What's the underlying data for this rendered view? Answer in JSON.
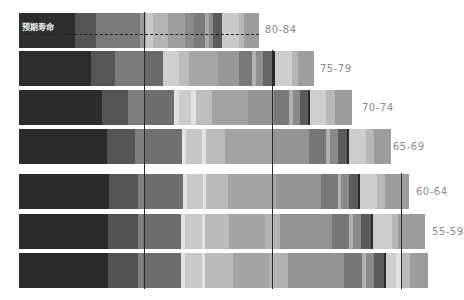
{
  "chart_data": {
    "type": "bar",
    "orientation": "horizontal-stacked",
    "title": "预期寿命",
    "annotation": "预期寿命",
    "categories": [
      "80-84",
      "75-79",
      "70-74",
      "65-69",
      "60-64",
      "55-59",
      ""
    ],
    "bar_lengths_px": [
      240,
      295,
      337,
      368,
      390,
      406,
      416
    ],
    "series_note": "Each bar is composed of many grayscale segments; widths estimated in pixels",
    "vertical_markers_x_px": [
      144,
      272,
      401
    ],
    "grid": false,
    "legend": "none"
  },
  "bars": [
    {
      "label": "80-84",
      "top": 13,
      "segments": [
        {
          "w": 56,
          "c": "#2e2e2e"
        },
        {
          "w": 21,
          "c": "#555555"
        },
        {
          "w": 44,
          "c": "#7a7a7a"
        },
        {
          "w": 6,
          "c": "#9a9a9a"
        },
        {
          "w": 7,
          "c": "#c8c8c8"
        },
        {
          "w": 15,
          "c": "#b4b4b4"
        },
        {
          "w": 17,
          "c": "#9e9e9e"
        },
        {
          "w": 9,
          "c": "#8a8a8a"
        },
        {
          "w": 11,
          "c": "#7b7b7b"
        },
        {
          "w": 4,
          "c": "#a8a8a8"
        },
        {
          "w": 4,
          "c": "#8a8a8a"
        },
        {
          "w": 9,
          "c": "#5a5a5a"
        },
        {
          "w": 17,
          "c": "#cacaca"
        },
        {
          "w": 5,
          "c": "#b8b8b8"
        },
        {
          "w": 15,
          "c": "#9c9c9c"
        }
      ]
    },
    {
      "label": "75-79",
      "top": 51,
      "segments": [
        {
          "w": 72,
          "c": "#2d2d2d"
        },
        {
          "w": 24,
          "c": "#565656"
        },
        {
          "w": 30,
          "c": "#7a7a7a"
        },
        {
          "w": 18,
          "c": "#6a6a6a"
        },
        {
          "w": 16,
          "c": "#cfcfcf"
        },
        {
          "w": 10,
          "c": "#bcbcbc"
        },
        {
          "w": 29,
          "c": "#a6a6a6"
        },
        {
          "w": 21,
          "c": "#979797"
        },
        {
          "w": 13,
          "c": "#787878"
        },
        {
          "w": 4,
          "c": "#b2b2b2"
        },
        {
          "w": 7,
          "c": "#8e8e8e"
        },
        {
          "w": 9,
          "c": "#666666"
        },
        {
          "w": 3,
          "c": "#2a2a2a"
        },
        {
          "w": 17,
          "c": "#cdcdcd"
        },
        {
          "w": 6,
          "c": "#b5b5b5"
        },
        {
          "w": 16,
          "c": "#9e9e9e"
        }
      ]
    },
    {
      "label": "70-74",
      "top": 90,
      "segments": [
        {
          "w": 83,
          "c": "#2c2c2c"
        },
        {
          "w": 26,
          "c": "#545454"
        },
        {
          "w": 16,
          "c": "#7e7e7e"
        },
        {
          "w": 30,
          "c": "#6e6e6e"
        },
        {
          "w": 5,
          "c": "#e0e0e0"
        },
        {
          "w": 12,
          "c": "#cbcbcb"
        },
        {
          "w": 5,
          "c": "#e3e3e3"
        },
        {
          "w": 16,
          "c": "#bebebe"
        },
        {
          "w": 36,
          "c": "#a3a3a3"
        },
        {
          "w": 26,
          "c": "#939393"
        },
        {
          "w": 15,
          "c": "#787878"
        },
        {
          "w": 4,
          "c": "#b0b0b0"
        },
        {
          "w": 7,
          "c": "#8b8b8b"
        },
        {
          "w": 8,
          "c": "#5c5c5c"
        },
        {
          "w": 2,
          "c": "#2a2a2a"
        },
        {
          "w": 16,
          "c": "#cfcfcf"
        },
        {
          "w": 9,
          "c": "#b8b8b8"
        },
        {
          "w": 17,
          "c": "#9c9c9c"
        }
      ]
    },
    {
      "label": "65-69",
      "top": 129,
      "segments": [
        {
          "w": 88,
          "c": "#2b2b2b"
        },
        {
          "w": 28,
          "c": "#555555"
        },
        {
          "w": 10,
          "c": "#7f7f7f"
        },
        {
          "w": 37,
          "c": "#6f6f6f"
        },
        {
          "w": 4,
          "c": "#e4e4e4"
        },
        {
          "w": 16,
          "c": "#c8c8c8"
        },
        {
          "w": 4,
          "c": "#e2e2e2"
        },
        {
          "w": 19,
          "c": "#bcbcbc"
        },
        {
          "w": 47,
          "c": "#a3a3a3"
        },
        {
          "w": 37,
          "c": "#949494"
        },
        {
          "w": 17,
          "c": "#777777"
        },
        {
          "w": 4,
          "c": "#b0b0b0"
        },
        {
          "w": 8,
          "c": "#8a8a8a"
        },
        {
          "w": 9,
          "c": "#5b5b5b"
        },
        {
          "w": 2,
          "c": "#2a2a2a"
        },
        {
          "w": 17,
          "c": "#cdcdcd"
        },
        {
          "w": 8,
          "c": "#b8b8b8"
        },
        {
          "w": 17,
          "c": "#9c9c9c"
        }
      ]
    },
    {
      "label": "60-64",
      "top": 174,
      "segments": [
        {
          "w": 90,
          "c": "#2b2b2b"
        },
        {
          "w": 29,
          "c": "#545454"
        },
        {
          "w": 6,
          "c": "#808080"
        },
        {
          "w": 39,
          "c": "#6e6e6e"
        },
        {
          "w": 4,
          "c": "#e2e2e2"
        },
        {
          "w": 16,
          "c": "#c9c9c9"
        },
        {
          "w": 3,
          "c": "#e2e2e2"
        },
        {
          "w": 22,
          "c": "#bbbbbb"
        },
        {
          "w": 48,
          "c": "#a4a4a4"
        },
        {
          "w": 45,
          "c": "#939393"
        },
        {
          "w": 17,
          "c": "#787878"
        },
        {
          "w": 3,
          "c": "#b0b0b0"
        },
        {
          "w": 8,
          "c": "#8a8a8a"
        },
        {
          "w": 9,
          "c": "#5c5c5c"
        },
        {
          "w": 2,
          "c": "#2a2a2a"
        },
        {
          "w": 17,
          "c": "#cdcdcd"
        },
        {
          "w": 8,
          "c": "#b8b8b8"
        },
        {
          "w": 24,
          "c": "#9c9c9c"
        }
      ]
    },
    {
      "label": "55-59",
      "top": 214,
      "segments": [
        {
          "w": 89,
          "c": "#2a2a2a"
        },
        {
          "w": 30,
          "c": "#535353"
        },
        {
          "w": 5,
          "c": "#808080"
        },
        {
          "w": 38,
          "c": "#6d6d6d"
        },
        {
          "w": 4,
          "c": "#e2e2e2"
        },
        {
          "w": 17,
          "c": "#c9c9c9"
        },
        {
          "w": 3,
          "c": "#e2e2e2"
        },
        {
          "w": 24,
          "c": "#bbbbbb"
        },
        {
          "w": 36,
          "c": "#a4a4a4"
        },
        {
          "w": 15,
          "c": "#b2b2b2"
        },
        {
          "w": 52,
          "c": "#939393"
        },
        {
          "w": 17,
          "c": "#777777"
        },
        {
          "w": 4,
          "c": "#b0b0b0"
        },
        {
          "w": 8,
          "c": "#8a8a8a"
        },
        {
          "w": 10,
          "c": "#5b5b5b"
        },
        {
          "w": 2,
          "c": "#2a2a2a"
        },
        {
          "w": 19,
          "c": "#cdcdcd"
        },
        {
          "w": 6,
          "c": "#b8b8b8"
        },
        {
          "w": 27,
          "c": "#9c9c9c"
        }
      ]
    },
    {
      "label": "",
      "top": 253,
      "segments": [
        {
          "w": 89,
          "c": "#2a2a2a"
        },
        {
          "w": 30,
          "c": "#535353"
        },
        {
          "w": 5,
          "c": "#808080"
        },
        {
          "w": 38,
          "c": "#6d6d6d"
        },
        {
          "w": 4,
          "c": "#e2e2e2"
        },
        {
          "w": 17,
          "c": "#c9c9c9"
        },
        {
          "w": 3,
          "c": "#e2e2e2"
        },
        {
          "w": 28,
          "c": "#bbbbbb"
        },
        {
          "w": 36,
          "c": "#a4a4a4"
        },
        {
          "w": 19,
          "c": "#b2b2b2"
        },
        {
          "w": 56,
          "c": "#939393"
        },
        {
          "w": 18,
          "c": "#777777"
        },
        {
          "w": 4,
          "c": "#b0b0b0"
        },
        {
          "w": 8,
          "c": "#8a8a8a"
        },
        {
          "w": 10,
          "c": "#5b5b5b"
        },
        {
          "w": 2,
          "c": "#2a2a2a"
        },
        {
          "w": 10,
          "c": "#cdcdcd"
        },
        {
          "w": 6,
          "c": "#e0e0e0"
        },
        {
          "w": 8,
          "c": "#b8b8b8"
        },
        {
          "w": 18,
          "c": "#9c9c9c"
        }
      ]
    }
  ],
  "vlines": [
    {
      "x": 144,
      "top": 12,
      "height": 277
    },
    {
      "x": 272,
      "top": 50,
      "height": 239
    },
    {
      "x": 401,
      "top": 173,
      "height": 116
    }
  ],
  "age_labels": [
    {
      "text": "80-84",
      "x": 265,
      "y": 24
    },
    {
      "text": "75-79",
      "x": 320,
      "y": 63
    },
    {
      "text": "70-74",
      "x": 362,
      "y": 102
    },
    {
      "text": "65-69",
      "x": 393,
      "y": 141
    },
    {
      "text": "60-64",
      "x": 416,
      "y": 186
    },
    {
      "text": "55-59",
      "x": 432,
      "y": 226
    }
  ]
}
